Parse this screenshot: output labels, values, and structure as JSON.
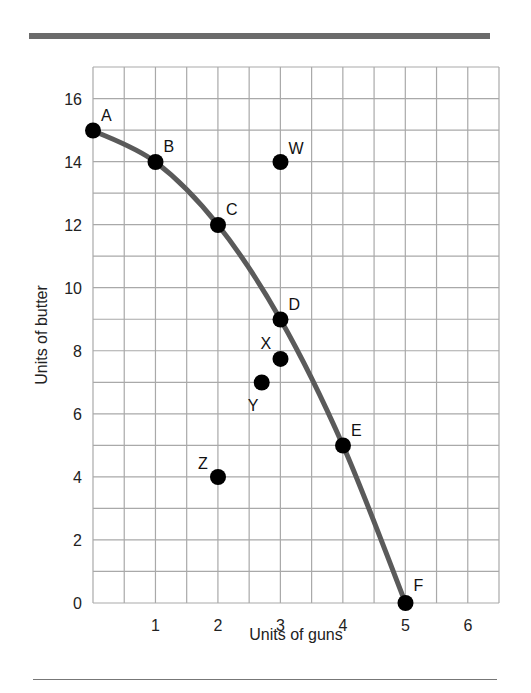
{
  "page": {
    "top_clipped_text": "graphs"
  },
  "chart_data": {
    "type": "scatter",
    "title": "",
    "xlabel": "Units of guns",
    "ylabel": "Units of butter",
    "xlim": [
      0,
      6.5
    ],
    "ylim": [
      0,
      17
    ],
    "grid": true,
    "x_ticks": [
      1,
      2,
      3,
      4,
      5,
      6
    ],
    "y_ticks": [
      0,
      2,
      4,
      6,
      8,
      10,
      12,
      14,
      16
    ],
    "x_tick_labels": [
      "1",
      "2",
      "3",
      "4",
      "5",
      "6"
    ],
    "y_tick_labels": [
      "0",
      "2",
      "4",
      "6",
      "8",
      "10",
      "12",
      "14",
      "16"
    ],
    "series": [
      {
        "name": "Production possibilities frontier",
        "kind": "curve",
        "color": "#5a5a5a",
        "points": [
          {
            "label": "A",
            "x": 0,
            "y": 15
          },
          {
            "label": "B",
            "x": 1,
            "y": 14
          },
          {
            "label": "C",
            "x": 2,
            "y": 12
          },
          {
            "label": "D",
            "x": 3,
            "y": 9
          },
          {
            "label": "E",
            "x": 4,
            "y": 5
          },
          {
            "label": "F",
            "x": 5,
            "y": 0
          }
        ]
      },
      {
        "name": "Other points",
        "kind": "points",
        "color": "#000000",
        "points": [
          {
            "label": "W",
            "x": 3,
            "y": 14
          },
          {
            "label": "X",
            "x": 3,
            "y": 7.75
          },
          {
            "label": "Y",
            "x": 2.7,
            "y": 7
          },
          {
            "label": "Z",
            "x": 2,
            "y": 4
          }
        ]
      }
    ],
    "legend": "none"
  }
}
